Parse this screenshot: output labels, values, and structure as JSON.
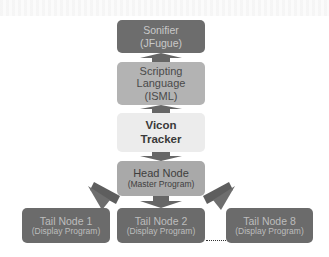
{
  "diagram": {
    "type": "system-architecture-flow",
    "nodes": {
      "sonifier": {
        "line1": "Sonifier",
        "line2": "(JFugue)"
      },
      "scripting": {
        "line1": "Scripting",
        "line2": "Language",
        "line3": "(ISML)"
      },
      "vicon": {
        "line1": "Vicon",
        "line2": "Tracker"
      },
      "head": {
        "line1": "Head Node",
        "line2": "(Master Program)"
      },
      "tails": [
        {
          "line1": "Tail Node 1",
          "line2": "(Display Program)"
        },
        {
          "line1": "Tail Node 2",
          "line2": "(Display Program)"
        },
        {
          "line1": "Tail Node 8",
          "line2": "(Display Program)"
        }
      ]
    },
    "edges": [
      {
        "from": "scripting",
        "to": "sonifier",
        "direction": "up"
      },
      {
        "from": "vicon",
        "to": "scripting",
        "direction": "up"
      },
      {
        "from": "vicon",
        "to": "head",
        "direction": "down"
      },
      {
        "from": "head",
        "to": "tail-node-1",
        "direction": "down-left"
      },
      {
        "from": "head",
        "to": "tail-node-2",
        "direction": "down"
      },
      {
        "from": "head",
        "to": "tail-node-8",
        "direction": "down-right"
      }
    ],
    "ellipsis": "......",
    "colors": {
      "dark_node": "#6d6d6d",
      "scripting_node": "#b3b3b3",
      "vicon_node": "#ececec",
      "head_node": "#a9a9a9",
      "arrow": "#666666"
    }
  }
}
